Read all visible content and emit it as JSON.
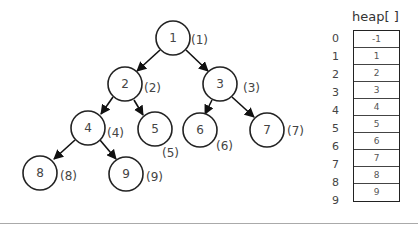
{
  "tree": {
    "nodes": [
      {
        "value": "1",
        "index_label": "(1)"
      },
      {
        "value": "2",
        "index_label": "(2)"
      },
      {
        "value": "3",
        "index_label": "(3)"
      },
      {
        "value": "4",
        "index_label": "(4)"
      },
      {
        "value": "5",
        "index_label": "(5)"
      },
      {
        "value": "6",
        "index_label": "(6)"
      },
      {
        "value": "7",
        "index_label": "(7)"
      },
      {
        "value": "8",
        "index_label": "(8)"
      },
      {
        "value": "9",
        "index_label": "(9)"
      }
    ],
    "edges": [
      [
        1,
        2
      ],
      [
        1,
        3
      ],
      [
        2,
        4
      ],
      [
        2,
        5
      ],
      [
        3,
        6
      ],
      [
        3,
        7
      ],
      [
        4,
        8
      ],
      [
        4,
        9
      ]
    ]
  },
  "heap": {
    "title": "heap[ ]",
    "indices": [
      "0",
      "1",
      "2",
      "3",
      "4",
      "5",
      "6",
      "7",
      "8",
      "9"
    ],
    "values": [
      "-1",
      "1",
      "2",
      "3",
      "4",
      "5",
      "6",
      "7",
      "8",
      "9"
    ]
  }
}
